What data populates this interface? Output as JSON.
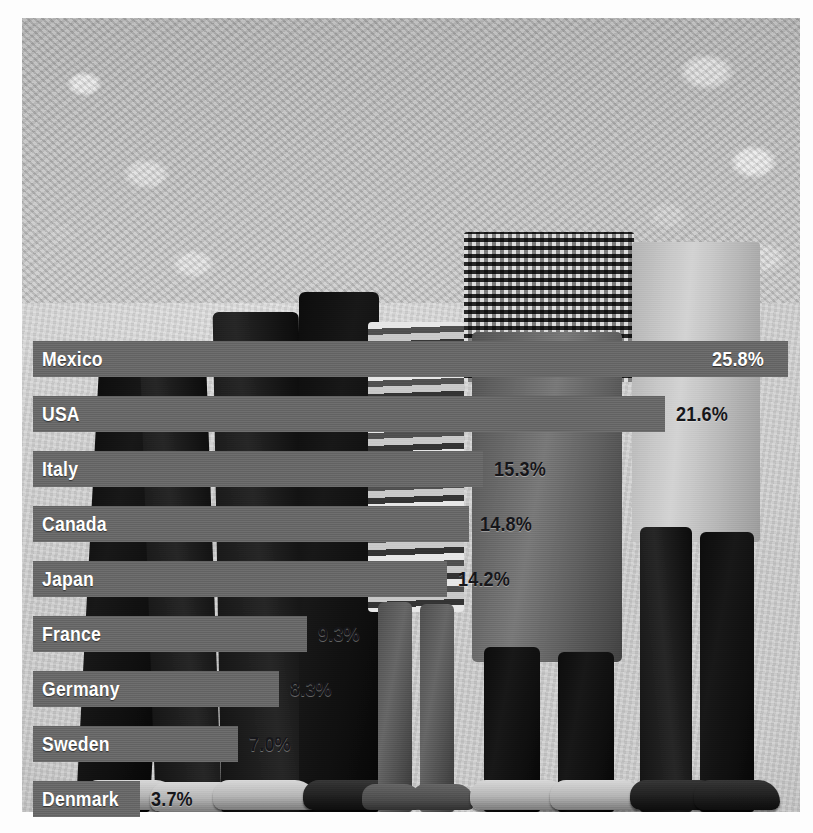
{
  "chart_data": {
    "type": "bar",
    "orientation": "horizontal",
    "title": "",
    "subtitle": "",
    "xlabel": "",
    "ylabel": "",
    "xlim": [
      0,
      27
    ],
    "grid": false,
    "legend": false,
    "value_suffix": "%",
    "categories": [
      "Mexico",
      "USA",
      "Italy",
      "Canada",
      "Japan",
      "France",
      "Germany",
      "Sweden",
      "Denmark"
    ],
    "values": [
      25.8,
      21.6,
      15.3,
      14.8,
      14.2,
      9.3,
      8.3,
      7.0,
      3.7
    ],
    "value_labels": [
      "25.8%",
      "21.6%",
      "15.3%",
      "14.8%",
      "14.2%",
      "9.3%",
      "8.3%",
      "7.0%",
      "3.7%"
    ],
    "label_placement": [
      "inside",
      "outside",
      "outside",
      "outside",
      "outside",
      "outside",
      "outside",
      "outside",
      "outside"
    ],
    "bars": [
      {
        "label": "Mexico",
        "value": 25.8,
        "value_label": "25.8%",
        "bar_width_px": 755,
        "label_placement": "inside"
      },
      {
        "label": "USA",
        "value": 21.6,
        "value_label": "21.6%",
        "bar_width_px": 632,
        "label_placement": "outside"
      },
      {
        "label": "Italy",
        "value": 15.3,
        "value_label": "15.3%",
        "bar_width_px": 450,
        "label_placement": "outside"
      },
      {
        "label": "Canada",
        "value": 14.8,
        "value_label": "14.8%",
        "bar_width_px": 436,
        "label_placement": "outside"
      },
      {
        "label": "Japan",
        "value": 14.2,
        "value_label": "14.2%",
        "bar_width_px": 414,
        "label_placement": "outside"
      },
      {
        "label": "France",
        "value": 9.3,
        "value_label": "9.3%",
        "bar_width_px": 274,
        "label_placement": "outside"
      },
      {
        "label": "Germany",
        "value": 8.3,
        "value_label": "8.3%",
        "bar_width_px": 246,
        "label_placement": "outside"
      },
      {
        "label": "Sweden",
        "value": 7.0,
        "value_label": "7.0%",
        "bar_width_px": 205,
        "label_placement": "outside"
      },
      {
        "label": "Denmark",
        "value": 3.7,
        "value_label": "3.7%",
        "bar_width_px": 107,
        "label_placement": "outside"
      }
    ]
  },
  "colors": {
    "bar_fill": "#6d6d6d",
    "label_inside": "#ffffff",
    "label_outside": "#16161a",
    "photo_ground": "#cfcfcf",
    "page_background": "#ffffff"
  },
  "photo": {
    "description": "black-and-white photograph of children's legs and feet standing on pavement, some barefoot and some wearing shoes"
  }
}
